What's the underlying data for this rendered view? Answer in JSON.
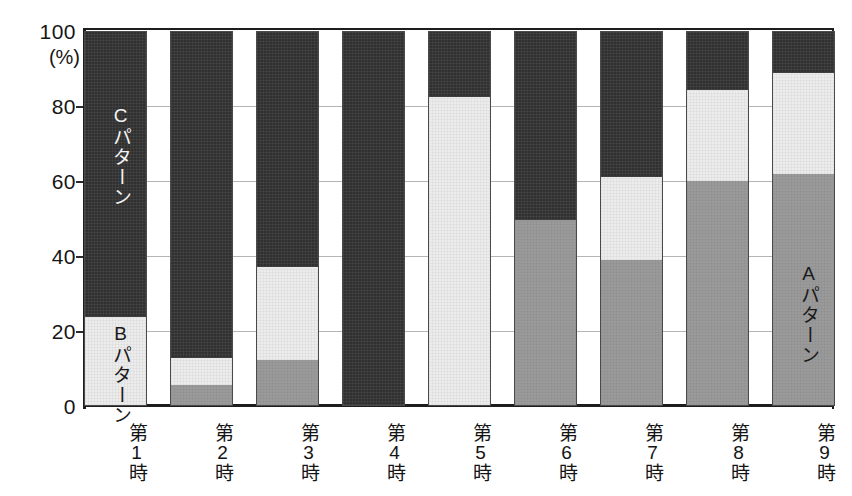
{
  "chart_data": {
    "type": "bar",
    "subtype": "stacked-100-percent",
    "title": "",
    "xlabel": "",
    "ylabel": "(%)",
    "ylim": [
      0,
      100
    ],
    "yticks": [
      0,
      20,
      40,
      60,
      80,
      100
    ],
    "ytick_labels": [
      "0",
      "20",
      "40",
      "60",
      "80",
      "100"
    ],
    "grid": true,
    "grid_axis": "y",
    "legend": "in-chart annotations",
    "categories": [
      "第1時",
      "第2時",
      "第3時",
      "第4時",
      "第5時",
      "第6時",
      "第7時",
      "第8時",
      "第9時"
    ],
    "series": [
      {
        "name": "Aパターン",
        "color": "#9a9a9a",
        "stack_order": 0,
        "values": [
          0,
          5.5,
          12,
          0,
          0,
          49.5,
          39,
          60,
          62
        ]
      },
      {
        "name": "Bパターン",
        "color": "#ececec",
        "stack_order": 1,
        "values": [
          23.5,
          7,
          25,
          0,
          82.5,
          0,
          22,
          24.5,
          27
        ]
      },
      {
        "name": "Cパターン",
        "color": "#303030",
        "stack_order": 2,
        "values": [
          76.5,
          87.5,
          63,
          100,
          17.5,
          50.5,
          39,
          15.5,
          11
        ]
      }
    ],
    "annotations": [
      {
        "text": "Cパターン",
        "bar_index": 0,
        "series": "Cパターン",
        "orientation": "vertical"
      },
      {
        "text": "Bパターン",
        "bar_index": 0,
        "series": "Bパターン",
        "orientation": "vertical"
      },
      {
        "text": "Aパターン",
        "bar_index": 8,
        "series": "Aパターン",
        "orientation": "vertical"
      }
    ]
  },
  "axis": {
    "unit_label": "(%)",
    "ticks": [
      "100",
      "80",
      "60",
      "40",
      "20",
      "0"
    ]
  },
  "colors": {
    "pattern_a": "#9a9a9a",
    "pattern_b": "#ececec",
    "pattern_c": "#303030",
    "axis": "#1d1d1d",
    "grid": "#b5b5b5",
    "background": "#ffffff"
  }
}
